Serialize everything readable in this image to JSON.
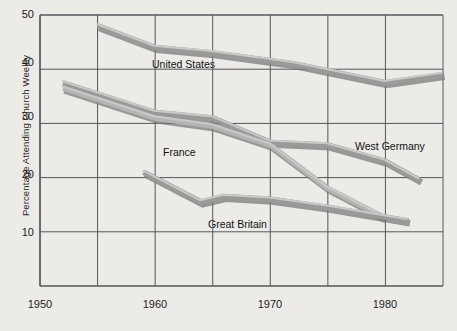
{
  "chart_data": {
    "type": "line",
    "title": "",
    "xlabel": "",
    "ylabel": "Percentage Attending Church Weekly",
    "xlim": [
      1950,
      1985
    ],
    "ylim": [
      0,
      50
    ],
    "xticks": [
      1950,
      1960,
      1970,
      1980
    ],
    "xtick_labels": [
      "1950",
      "1960",
      "1970",
      "1980"
    ],
    "gridlines_x": [
      1950,
      1955,
      1960,
      1965,
      1970,
      1975,
      1980,
      1985
    ],
    "yticks": [
      10,
      20,
      30,
      40,
      50
    ],
    "ytick_labels": [
      "10",
      "20",
      "30",
      "40",
      "50"
    ],
    "grid": true,
    "legend_position": "inline-annotations",
    "series": [
      {
        "name": "United States",
        "label": "United States",
        "color": "#9a9a9a",
        "x": [
          1955,
          1960,
          1965,
          1972,
          1980,
          1985
        ],
        "values": [
          48,
          44,
          43,
          41,
          37.5,
          39
        ]
      },
      {
        "name": "West Germany",
        "label": "West Germany",
        "color": "#9a9a9a",
        "x": [
          1952,
          1960,
          1965,
          1970,
          1975,
          1980,
          1983
        ],
        "values": [
          37.5,
          32,
          31,
          26.5,
          26,
          23,
          19.5
        ]
      },
      {
        "name": "France",
        "label": "France",
        "color": "#b4b4b4",
        "x": [
          1952,
          1960,
          1965,
          1970,
          1975,
          1980
        ],
        "values": [
          36.5,
          31,
          29.5,
          26,
          18,
          12.5
        ]
      },
      {
        "name": "Great Britain",
        "label": "Great Britain",
        "color": "#9a9a9a",
        "x": [
          1959,
          1964,
          1966,
          1970,
          1975,
          1982
        ],
        "values": [
          21,
          15.5,
          16.5,
          16,
          14.5,
          12
        ]
      }
    ],
    "annotations": [
      {
        "text": "United States",
        "x": 1963,
        "y": 41.5
      },
      {
        "text": "France",
        "x": 1964,
        "y": 25.5
      },
      {
        "text": "West Germany",
        "x": 1977,
        "y": 26.5
      },
      {
        "text": "Great Britain",
        "x": 1966,
        "y": 14.5
      }
    ]
  },
  "axis": {
    "y_title": "Percentage Attending Church Weekly",
    "y_ticks": [
      "50",
      "40",
      "30",
      "20",
      "10"
    ],
    "x_ticks": [
      "1950",
      "1960",
      "1970",
      "1980"
    ]
  },
  "labels": {
    "united_states": "United States",
    "west_germany": "West Germany",
    "france": "France",
    "great_britain": "Great Britain"
  },
  "colors": {
    "background": "#ecebe8",
    "grid": "#55565a",
    "line_dark": "#9a9a9a",
    "line_light": "#c9c9c5",
    "line_shadow": "#7b7b7b",
    "text": "#1c1c1c"
  }
}
